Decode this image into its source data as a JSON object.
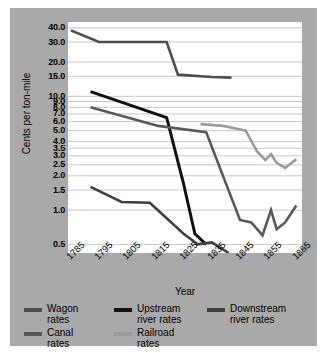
{
  "chart_data": {
    "type": "line",
    "title": "",
    "xlabel": "Year",
    "ylabel": "Cents per ton-mile",
    "yscale": "log",
    "ylim": [
      0.42,
      45
    ],
    "xlim": [
      1785,
      1868
    ],
    "grid": true,
    "legend_position": "below",
    "x_ticks": [
      "1785",
      "1795",
      "1805",
      "1815",
      "1825",
      "1835",
      "1845",
      "1855",
      "1865"
    ],
    "x_tick_values": [
      1785,
      1795,
      1805,
      1815,
      1825,
      1835,
      1845,
      1855,
      1865
    ],
    "y_ticks": [
      "40.0",
      "30.0",
      "20.0",
      "15.0",
      "10.0",
      "9.0",
      "8.0",
      "7.0",
      "6.0",
      "5.0",
      "4.0",
      "3.5",
      "3.0",
      "2.5",
      "2.0",
      "1.5",
      "1.0",
      "0.5"
    ],
    "y_tick_values": [
      40.0,
      30.0,
      20.0,
      15.0,
      10.0,
      9.0,
      8.0,
      7.0,
      6.0,
      5.0,
      4.0,
      3.5,
      3.0,
      2.5,
      2.0,
      1.5,
      1.0,
      0.5
    ],
    "series": [
      {
        "name": "Wagon rates",
        "color": "#4d4d4d",
        "width": 2.6,
        "x": [
          1786,
          1796,
          1814,
          1820,
          1824,
          1836,
          1843
        ],
        "values": [
          38.0,
          30.0,
          30.0,
          30.0,
          15.5,
          14.8,
          14.6
        ]
      },
      {
        "name": "Upstream river rates",
        "color": "#111111",
        "width": 3.0,
        "x": [
          1793,
          1820,
          1826,
          1830,
          1834
        ],
        "values": [
          11.0,
          6.5,
          1.7,
          0.62,
          0.5
        ]
      },
      {
        "name": "Downstream river rates",
        "color": "#3f3f3f",
        "width": 2.6,
        "x": [
          1793,
          1804,
          1814,
          1826,
          1831,
          1836,
          1842
        ],
        "values": [
          1.6,
          1.18,
          1.16,
          0.62,
          0.5,
          0.52,
          0.42
        ]
      },
      {
        "name": "Canal rates",
        "color": "#585858",
        "width": 2.6,
        "x": [
          1793,
          1817,
          1834,
          1846,
          1850,
          1854,
          1857,
          1859,
          1862,
          1866
        ],
        "values": [
          8.0,
          5.5,
          4.85,
          0.82,
          0.78,
          0.6,
          1.0,
          0.68,
          0.78,
          1.1
        ]
      },
      {
        "name": "Railroad rates",
        "color": "#9a9a9a",
        "width": 2.6,
        "x": [
          1832,
          1840,
          1848,
          1852,
          1855,
          1857,
          1859,
          1862,
          1866
        ],
        "values": [
          5.7,
          5.5,
          5.0,
          3.3,
          2.75,
          3.1,
          2.6,
          2.35,
          2.8
        ]
      }
    ]
  },
  "axes": {
    "ylabel": "Cents per ton-mile",
    "xlabel": "Year"
  },
  "legend": {
    "items": [
      {
        "label": "Wagon\nrates",
        "color": "#4d4d4d"
      },
      {
        "label": "Upstream\nriver rates",
        "color": "#111111"
      },
      {
        "label": "Downstream\nriver rates",
        "color": "#3f3f3f"
      },
      {
        "label": "Canal\nrates",
        "color": "#585858"
      },
      {
        "label": "Railroad\nrates",
        "color": "#9a9a9a"
      }
    ]
  },
  "colors": {
    "figure_background": "#a9a9a9",
    "plot_background": "#ffffff",
    "gridline": "#c9c9c9",
    "text": "#000000"
  }
}
